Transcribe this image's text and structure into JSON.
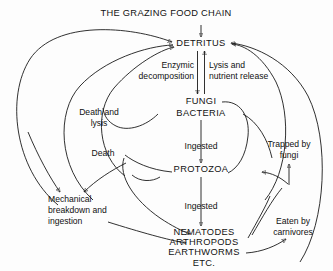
{
  "diagram": {
    "title": "THE GRAZING FOOD CHAIN",
    "type": "detritus-food-chain-flow-diagram",
    "nodes": {
      "detritus": "DETRITUS",
      "fungi": "FUNGI",
      "bacteria": "BACTERIA",
      "protozoa": "PROTOZOA",
      "nematodes": "NEMATODES",
      "arthropods": "ARTHROPODS",
      "earthworms": "EARTHWORMS",
      "etc": "ETC."
    },
    "edge_labels": {
      "enzymic_1": "Enzymic",
      "enzymic_2": "decomposition",
      "lysis_1": "Lysis and",
      "lysis_2": "nutrient release",
      "death_lysis_1": "Death and",
      "death_lysis_2": "lysis",
      "ingested_upper": "Ingested",
      "death": "Death",
      "trapped_1": "Trapped by",
      "trapped_2": "fungi",
      "mechanical_1": "Mechanical",
      "mechanical_2": "breakdown and",
      "mechanical_3": "ingestion",
      "ingested_lower": "Ingested",
      "eaten_1": "Eaten by",
      "eaten_2": "carnivores"
    },
    "colors": {
      "ink": "#1a1a1a",
      "paper": "#fdfdfd"
    }
  }
}
